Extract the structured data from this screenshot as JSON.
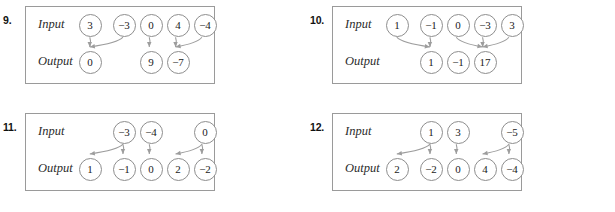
{
  "worksheet": {
    "row_labels": {
      "input": "Input",
      "output": "Output"
    },
    "colors": {
      "border": "#9a9a9a",
      "circle": "#8e8e8e",
      "arrow": "#9d9d9d",
      "text": "#1a1a1a"
    },
    "problems": [
      {
        "number": "9.",
        "input_label": "Input",
        "output_label": "Output",
        "inputs": [
          "3",
          "−3",
          "0",
          "4",
          "−4"
        ],
        "outputs": [
          "0",
          "",
          "9",
          "−7",
          ""
        ],
        "mappings": [
          {
            "from": 0,
            "to": 0
          },
          {
            "from": 1,
            "to": 0
          },
          {
            "from": 2,
            "to": 2
          },
          {
            "from": 3,
            "to": 3
          },
          {
            "from": 4,
            "to": 3
          }
        ]
      },
      {
        "number": "10.",
        "input_label": "Input",
        "output_label": "Output",
        "inputs": [
          "1",
          "−1",
          "0",
          "−3",
          "3"
        ],
        "outputs": [
          "",
          "1",
          "−1",
          "17",
          ""
        ],
        "mappings": [
          {
            "from": 0,
            "to": 1
          },
          {
            "from": 1,
            "to": 1
          },
          {
            "from": 2,
            "to": 3
          },
          {
            "from": 3,
            "to": 3
          },
          {
            "from": 4,
            "to": 3
          }
        ]
      },
      {
        "number": "11.",
        "input_label": "Input",
        "output_label": "Output",
        "inputs": [
          "",
          "−3",
          "−4",
          "",
          "0"
        ],
        "outputs": [
          "1",
          "−1",
          "0",
          "2",
          "−2"
        ],
        "mappings": [
          {
            "from": 1,
            "to": 0
          },
          {
            "from": 1,
            "to": 1
          },
          {
            "from": 2,
            "to": 2
          },
          {
            "from": 4,
            "to": 3
          },
          {
            "from": 4,
            "to": 4
          }
        ]
      },
      {
        "number": "12.",
        "input_label": "Input",
        "output_label": "Output",
        "inputs": [
          "",
          "1",
          "3",
          "",
          "−5"
        ],
        "outputs": [
          "2",
          "−2",
          "0",
          "4",
          "−4"
        ],
        "mappings": [
          {
            "from": 1,
            "to": 0
          },
          {
            "from": 1,
            "to": 1
          },
          {
            "from": 2,
            "to": 2
          },
          {
            "from": 4,
            "to": 3
          },
          {
            "from": 4,
            "to": 4
          }
        ]
      }
    ]
  }
}
